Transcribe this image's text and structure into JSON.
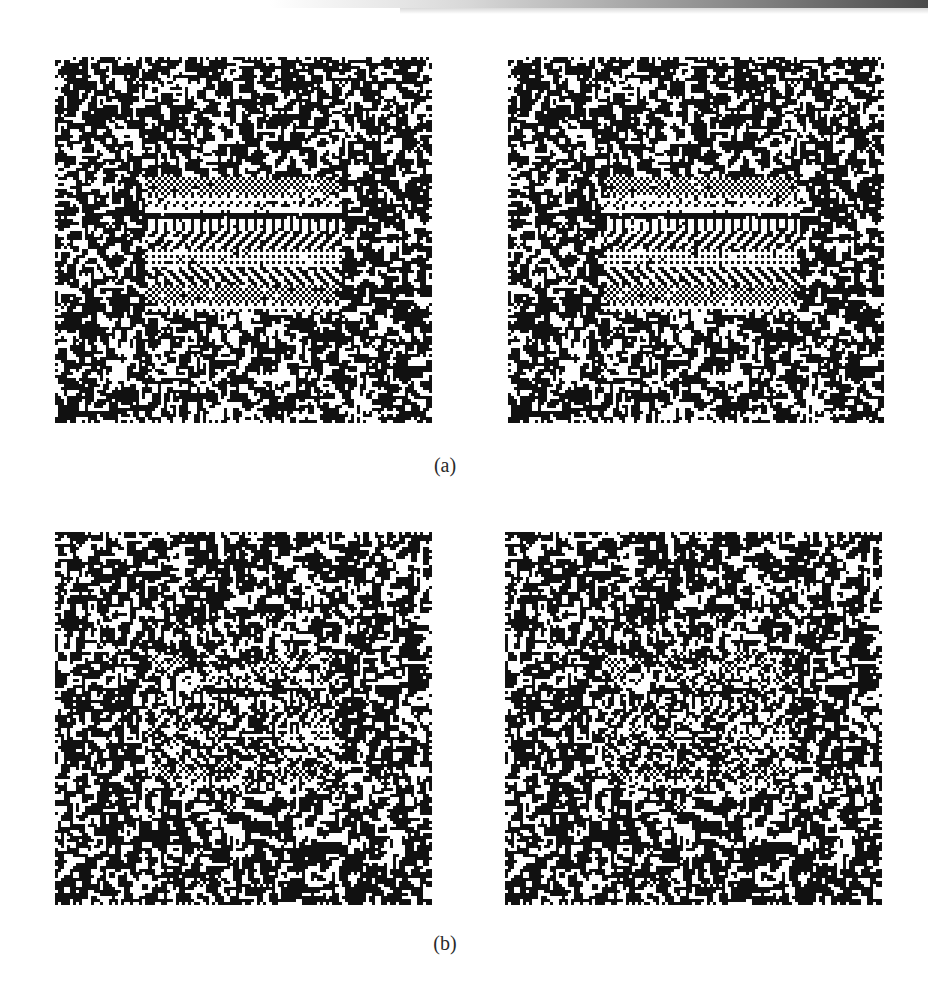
{
  "figure": {
    "rows": [
      {
        "caption": "(a)",
        "description": "Random-dot stereogram pair with high-contrast textured horizontal bands",
        "panels": [
          {
            "id": "a-left",
            "seed": 11,
            "x": 55,
            "y": 57,
            "w": 377,
            "h": 366,
            "style": "strong"
          },
          {
            "id": "a-right",
            "seed": 11,
            "x": 508,
            "y": 57,
            "w": 376,
            "h": 366,
            "style": "strong",
            "shift": 2
          }
        ]
      },
      {
        "caption": "(b)",
        "description": "Random-dot stereogram pair with weaker, noisier textured bands",
        "panels": [
          {
            "id": "b-left",
            "seed": 29,
            "x": 55,
            "y": 532,
            "w": 377,
            "h": 373,
            "style": "weak"
          },
          {
            "id": "b-right",
            "seed": 29,
            "x": 505,
            "y": 532,
            "w": 377,
            "h": 373,
            "style": "weak",
            "shift": 2
          }
        ]
      }
    ],
    "colors": {
      "ink": "#111111",
      "paper": "#ffffff",
      "caption": "#2a2a2a"
    },
    "cell_size_px": 3
  }
}
